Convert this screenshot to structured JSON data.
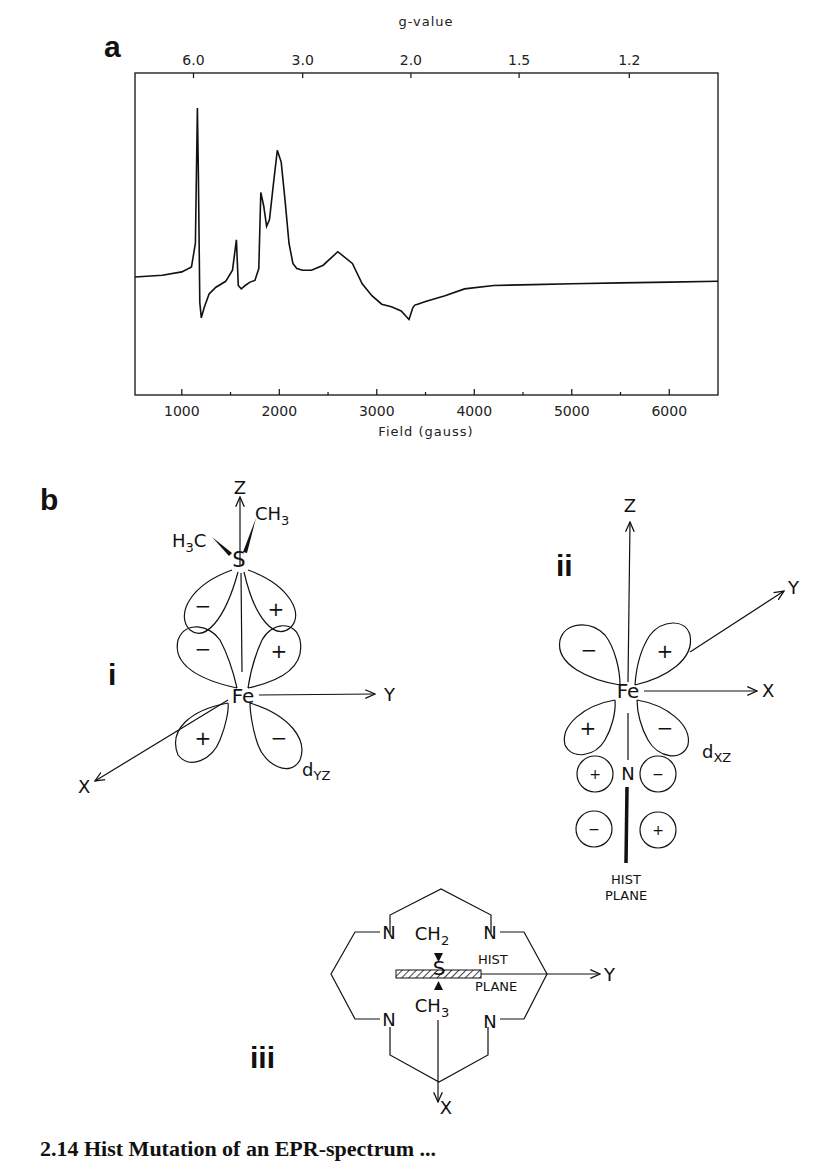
{
  "figure": {
    "panel_a_label": "a",
    "panel_b_label": "b",
    "caption_partial": "2.14 Hist Mutation of an EPR-spectrum ..."
  },
  "chart_data": {
    "type": "line",
    "title": "",
    "xlabel": "Field (gauss)",
    "ylabel": "",
    "top_axis_label": "g-value",
    "xlim": [
      520,
      6500
    ],
    "x_ticks": [
      1000,
      2000,
      3000,
      4000,
      5000,
      6000
    ],
    "x_tick_labels": [
      "1000",
      "2000",
      "3000",
      "4000",
      "5000",
      "6000"
    ],
    "x_minor_ticks": [
      1500,
      2500,
      3500,
      4500,
      5500
    ],
    "top_ticks_g": [
      "6.0",
      "3.0",
      "2.0",
      "1.5",
      "1.2"
    ],
    "top_ticks_field": [
      1120,
      2240,
      3350,
      4460,
      5590
    ],
    "ylim": [
      -1,
      1
    ],
    "grid": false,
    "legend": "none",
    "series": [
      {
        "name": "EPR spectrum",
        "x": [
          520,
          800,
          1000,
          1100,
          1140,
          1160,
          1170,
          1185,
          1200,
          1230,
          1280,
          1350,
          1450,
          1520,
          1560,
          1580,
          1610,
          1650,
          1700,
          1750,
          1790,
          1810,
          1840,
          1870,
          1900,
          1940,
          1980,
          2020,
          2060,
          2100,
          2140,
          2180,
          2240,
          2330,
          2450,
          2600,
          2750,
          2850,
          2950,
          3050,
          3150,
          3250,
          3330,
          3370,
          3390,
          3420,
          3500,
          3700,
          3900,
          4200,
          4600,
          5000,
          5500,
          6000,
          6500
        ],
        "y": [
          0.0,
          0.01,
          0.03,
          0.06,
          0.2,
          1.0,
          0.6,
          -0.3,
          -0.48,
          -0.36,
          -0.2,
          -0.12,
          -0.05,
          0.04,
          0.22,
          -0.1,
          -0.14,
          -0.1,
          -0.06,
          -0.04,
          0.05,
          0.5,
          0.42,
          0.3,
          0.34,
          0.55,
          0.75,
          0.68,
          0.45,
          0.2,
          0.08,
          0.05,
          0.04,
          0.04,
          0.07,
          0.15,
          0.08,
          -0.08,
          -0.22,
          -0.32,
          -0.35,
          -0.4,
          -0.5,
          -0.36,
          -0.33,
          -0.32,
          -0.29,
          -0.22,
          -0.14,
          -0.1,
          -0.09,
          -0.08,
          -0.07,
          -0.06,
          -0.05
        ]
      }
    ]
  },
  "diagram_i": {
    "label": "i",
    "axis_z": "Z",
    "axis_y": "Y",
    "axis_x": "X",
    "atom_s": "S",
    "atom_fe": "Fe",
    "left_methyl": "H3C",
    "left_methyl_parts": [
      "H",
      "3",
      "C"
    ],
    "right_methyl_parts": [
      "CH",
      "3"
    ],
    "orbital_main": "d",
    "orbital_sub": "YZ",
    "lobe_signs": [
      "−",
      "+",
      "−",
      "+",
      "+",
      "−"
    ]
  },
  "diagram_ii": {
    "label": "ii",
    "axis_z": "Z",
    "axis_y": "Y",
    "axis_x": "X",
    "atom_fe": "Fe",
    "atom_n": "N",
    "orbital_main": "d",
    "orbital_sub": "XZ",
    "lobe_signs": [
      "−",
      "+",
      "+",
      "−"
    ],
    "p_orbital_signs": [
      "+",
      "−",
      "−",
      "+"
    ],
    "plane_label_1": "HIST",
    "plane_label_2": "PLANE"
  },
  "diagram_iii": {
    "label": "iii",
    "axis_y": "Y",
    "axis_x": "X",
    "atom_n": "N",
    "atom_s": "S",
    "top_group_parts": [
      "CH",
      "2"
    ],
    "bottom_group_parts": [
      "CH",
      "3"
    ],
    "plane_label_1": "HIST",
    "plane_label_2": "PLANE"
  }
}
